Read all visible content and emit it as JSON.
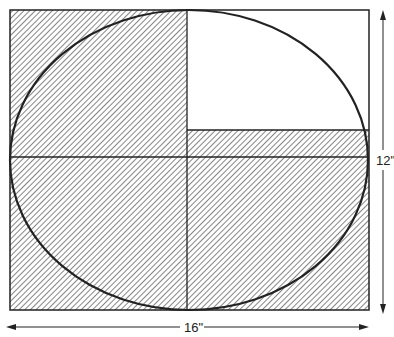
{
  "diagram": {
    "rectangle": {
      "x": 10,
      "y": 10,
      "width": 359,
      "height": 300
    },
    "ellipse": {
      "cx": 189,
      "cy": 160,
      "rx": 179,
      "ry": 151
    },
    "vertical_divider_x": 187,
    "horizontal_divider_y": 157,
    "strip_top_y": 130,
    "colors": {
      "line": "#222222",
      "hatch": "#444444",
      "background": "#ffffff"
    },
    "dimensions": {
      "height_label": "12\"",
      "width_label": "16\""
    }
  }
}
